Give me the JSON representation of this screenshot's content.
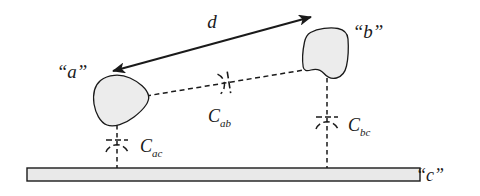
{
  "figure": {
    "type": "mechanical-schematic-diagram",
    "background_color": "#ffffff",
    "line_color": "#1a1a1a",
    "body_fill_color": "#ececec",
    "ground_fill_color": "#e8e8e8"
  },
  "labels": {
    "body_a": "“a”",
    "body_b": "“b”",
    "ground_c": "“c”",
    "distance_d": "d"
  },
  "compliance_labels": [
    {
      "id": "c-ab",
      "base": "C",
      "subscript": "ab",
      "full": "Cab",
      "between": [
        "a",
        "b"
      ]
    },
    {
      "id": "c-ac",
      "base": "C",
      "subscript": "ac",
      "full": "Cac",
      "between": [
        "a",
        "c"
      ]
    },
    {
      "id": "c-bc",
      "base": "C",
      "subscript": "bc",
      "full": "Cbc",
      "between": [
        "b",
        "c"
      ]
    }
  ],
  "elements": {
    "dimension_arrow": {
      "name": "d",
      "style": "double-headed-solid-arrow",
      "from": [
        113,
        71
      ],
      "to": [
        311,
        17
      ]
    },
    "connector_ab": {
      "style": "dashed",
      "from": [
        148,
        95
      ],
      "to": [
        303,
        70
      ]
    },
    "drop_line_a": {
      "style": "dashed",
      "from": [
        117,
        128
      ],
      "to": [
        117,
        170
      ]
    },
    "drop_line_b": {
      "style": "dashed",
      "from": [
        327,
        80
      ],
      "to": [
        327,
        170
      ]
    },
    "ground_bar": {
      "x": 27,
      "y": 168,
      "width": 393,
      "height": 13
    }
  }
}
